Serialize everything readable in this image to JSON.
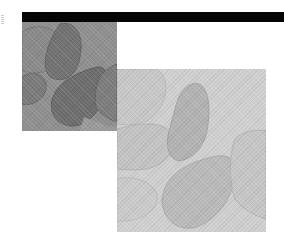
{
  "header": {
    "bar_color": "#050505"
  },
  "images": [
    {
      "name": "petal-photo-dark",
      "description": "grayscale close-up of overlapping petals, darker tone",
      "bg": "#8d8d8d",
      "shape_fill": "#6f6f6f",
      "shape_stroke": "#555555"
    },
    {
      "name": "petal-photo-light",
      "description": "grayscale close-up of overlapping petals, lighter tone",
      "bg": "#cfcfcf",
      "shape_fill": "#b9b9b9",
      "shape_stroke": "#a0a0a0"
    }
  ]
}
